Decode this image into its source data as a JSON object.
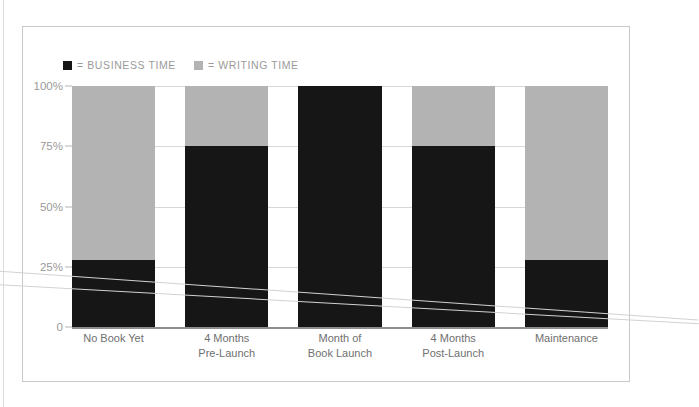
{
  "chart_data": {
    "type": "bar",
    "subtype": "stacked-bar-100-percent",
    "title": "",
    "subtitle": "",
    "xlabel": "",
    "ylabel": "",
    "ylim": [
      0,
      100
    ],
    "ytick_labels": [
      "100%",
      "75%",
      "50%",
      "25%",
      "0"
    ],
    "ytick_values": [
      100,
      75,
      50,
      25,
      0
    ],
    "grid": true,
    "legend_position": "top-left",
    "categories": [
      "No Book Yet",
      "4 Months Pre-Launch",
      "Month of Book Launch",
      "4 Months Post-Launch",
      "Maintenance"
    ],
    "category_label_lines": [
      [
        "No Book Yet",
        ""
      ],
      [
        "4 Months",
        "Pre-Launch"
      ],
      [
        "Month of",
        "Book Launch"
      ],
      [
        "4 Months",
        "Post-Launch"
      ],
      [
        "Maintenance",
        ""
      ]
    ],
    "series": [
      {
        "name": "BUSINESS TIME",
        "color": "#161616",
        "values": [
          28,
          75,
          100,
          75,
          28
        ]
      },
      {
        "name": "WRITING TIME",
        "color": "#b3b3b3",
        "values": [
          72,
          25,
          0,
          25,
          72
        ]
      }
    ]
  },
  "legend": {
    "items": [
      {
        "marker": "black-square-swatch",
        "label": "= BUSINESS TIME"
      },
      {
        "marker": "gray-square-swatch",
        "label": "= WRITING TIME"
      }
    ]
  },
  "colors": {
    "business": "#161616",
    "writing": "#b3b3b3",
    "grid": "#d8d8d8",
    "axis": "#8d8d8d",
    "frame": "#c9c9c9",
    "text": "#8a8a8a",
    "background": "#ffffff"
  }
}
